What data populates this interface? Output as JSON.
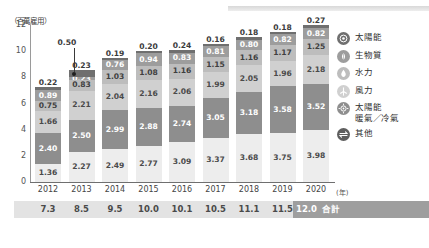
{
  "axis": {
    "y_title": "（百萬雇用）",
    "y_ticks": [
      "12",
      "10",
      "8",
      "6",
      "4",
      "2",
      "0"
    ],
    "x_unit": "(年)"
  },
  "callout": {
    "value": "0.50"
  },
  "total_row": {
    "values": [
      "7.3",
      "8.5",
      "9.5",
      "10.0",
      "10.1",
      "10.5",
      "11.1",
      "11.5"
    ],
    "highlight_value": "12.0",
    "highlight_label": "合計"
  },
  "legend": {
    "items": [
      {
        "label": "太陽能",
        "label2": "",
        "icon": "solar-pv-icon",
        "color": "#6f6f6f"
      },
      {
        "label": "生物質",
        "label2": "",
        "icon": "biomass-leaf-icon",
        "color": "#9d9d9d"
      },
      {
        "label": "水力",
        "label2": "",
        "icon": "hydro-drop-icon",
        "color": "#bdbdbd"
      },
      {
        "label": "風力",
        "label2": "",
        "icon": "wind-turbine-icon",
        "color": "#d0d0d0"
      },
      {
        "label": "太陽能",
        "label2": "暖氣／冷氣",
        "icon": "solar-thermal-icon",
        "color": "#8e8e8e"
      },
      {
        "label": "其他",
        "label2": "",
        "icon": "other-arrows-icon",
        "color": "#5e5e5e"
      }
    ]
  },
  "chart_data": {
    "type": "bar",
    "title": "",
    "xlabel": "(年)",
    "ylabel": "（百萬雇用）",
    "ylim": [
      0,
      12
    ],
    "grid": false,
    "legend_position": "right",
    "stacked": true,
    "categories": [
      "2012",
      "2013",
      "2014",
      "2015",
      "2016",
      "2017",
      "2018",
      "2019",
      "2020"
    ],
    "series": [
      {
        "name": "其他",
        "values": [
          1.36,
          2.27,
          2.49,
          2.77,
          3.09,
          3.37,
          3.68,
          3.75,
          3.98
        ]
      },
      {
        "name": "太陽能暖氣／冷氣",
        "values": [
          2.4,
          2.5,
          2.99,
          2.88,
          2.74,
          3.05,
          3.18,
          3.58,
          3.52
        ]
      },
      {
        "name": "風力",
        "values": [
          1.66,
          2.21,
          2.04,
          2.16,
          2.06,
          1.99,
          2.05,
          1.96,
          2.18
        ]
      },
      {
        "name": "水力",
        "values": [
          0.75,
          0.83,
          1.03,
          1.08,
          1.16,
          1.15,
          1.16,
          1.17,
          1.25
        ]
      },
      {
        "name": "生物質",
        "values": [
          0.89,
          0.23,
          0.76,
          0.94,
          0.83,
          0.81,
          0.8,
          0.82,
          0.82
        ]
      },
      {
        "name": "太陽能",
        "values": [
          0.22,
          0.5,
          0.19,
          0.2,
          0.24,
          0.16,
          0.18,
          0.18,
          0.27
        ]
      }
    ],
    "totals": [
      7.3,
      8.5,
      9.5,
      10.0,
      10.1,
      10.5,
      11.1,
      11.5,
      12.0
    ]
  }
}
